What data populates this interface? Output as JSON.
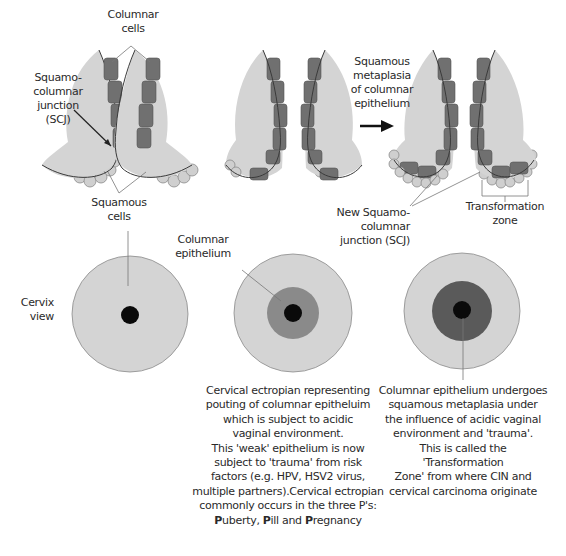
{
  "labels": {
    "columnar_cells": [
      "Columnar",
      "cells"
    ],
    "scj": [
      "Squamo-",
      "columnar",
      "junction",
      "(SCJ)"
    ],
    "squamous_cells": [
      "Squamous",
      "cells"
    ],
    "metaplasia": [
      "Squamous",
      "metaplasia",
      "of columnar",
      "epithelium"
    ],
    "new_scj": [
      "New Squamo-columnar",
      "junction (SCJ)"
    ],
    "transformation_zone": [
      "Transformation",
      "zone"
    ],
    "cervix_view": [
      "Cervix",
      "view"
    ],
    "columnar_epithelium": [
      "Columnar",
      "epithelium"
    ]
  },
  "captions": {
    "middle": [
      "Cervical ectropian representing",
      "pouting of columnar epitheluim",
      "which is subject to acidic",
      "vaginal environment.",
      "This 'weak' epithelium is now",
      "subject to 'trauma' from risk",
      "factors (e.g. HPV, HSV2 virus,",
      "multiple partners).Cervical ectropian",
      "commonly occurs in the three P's:"
    ],
    "middle_last": {
      "p1": "P",
      "w1": "uberty, ",
      "p2": "P",
      "w2": "ill and ",
      "p3": "P",
      "w3": "regnancy"
    },
    "right": [
      "Columnar epithelium undergoes",
      "squamous metaplasia under",
      "the influence of acidic vaginal",
      "environment and 'trauma'.",
      "This is called the 'Transformation",
      "Zone' from where CIN and",
      "cervical carcinoma originate"
    ]
  },
  "colors": {
    "stroma": "#d4d4d4",
    "columnar": "#707070",
    "squamous": "#cfcfcf",
    "os": "#0a0a0a",
    "outline": "#3a3a3a"
  }
}
